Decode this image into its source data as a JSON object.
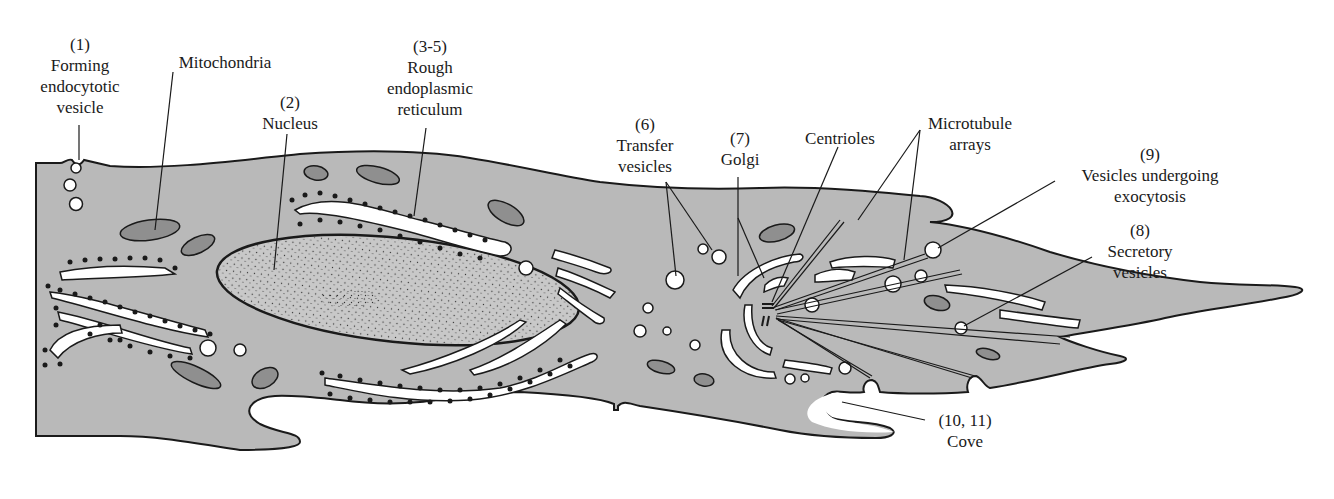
{
  "diagram": {
    "colors": {
      "cytoplasm": "#b9b9b9",
      "outline": "#1a1a1a",
      "lumen": "#ffffff",
      "mitochondria": "#8f8f8f",
      "background": "#ffffff"
    },
    "labels": {
      "forming_vesicle": {
        "number": "(1)",
        "line1": "Forming",
        "line2": "endocytotic",
        "line3": "vesicle"
      },
      "mitochondria": {
        "text": "Mitochondria"
      },
      "nucleus": {
        "number": "(2)",
        "text": "Nucleus"
      },
      "rer": {
        "number": "(3-5)",
        "line1": "Rough",
        "line2": "endoplasmic",
        "line3": "reticulum"
      },
      "transfer_vesicles": {
        "number": "(6)",
        "line1": "Transfer",
        "line2": "vesicles"
      },
      "golgi": {
        "number": "(7)",
        "text": "Golgi"
      },
      "centrioles": {
        "text": "Centrioles"
      },
      "microtubule_arrays": {
        "line1": "Microtubule",
        "line2": "arrays"
      },
      "exocytosis": {
        "number": "(9)",
        "line1": "Vesicles undergoing",
        "line2": "exocytosis"
      },
      "secretory": {
        "number": "(8)",
        "line1": "Secretory",
        "line2": "vesicles"
      },
      "cove": {
        "number": "(10, 11)",
        "text": "Cove"
      }
    }
  }
}
